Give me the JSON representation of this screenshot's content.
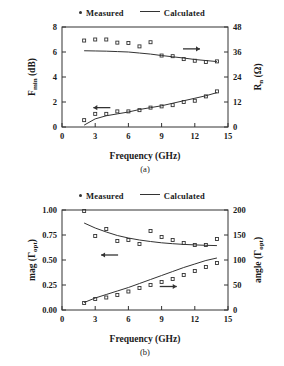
{
  "figure": {
    "caption_a": "(a)",
    "caption_b": "(b)"
  },
  "legend": {
    "measured_label": "Measured",
    "calculated_label": "Calculated",
    "measured_icon": "filled-dot-marker",
    "calculated_icon": "solid-line-sample"
  },
  "chart_data": [
    {
      "type": "scatter",
      "panel": "a",
      "title": "",
      "xlabel": "Frequency (GHz)",
      "ylabel_left": "F_min (dB)",
      "ylabel_left_display": "F",
      "ylabel_left_sub": "min",
      "ylabel_left_unit": " (dB)",
      "ylabel_right": "R_n (Ω)",
      "ylabel_right_display": "R",
      "ylabel_right_sub": "n",
      "ylabel_right_unit": " (Ω)",
      "xlim": [
        0,
        15
      ],
      "xticks": [
        0,
        3,
        6,
        9,
        12,
        15
      ],
      "xticklabels": [
        "0",
        "3",
        "6",
        "9",
        "12",
        "15"
      ],
      "ylim_left": [
        0,
        8
      ],
      "yticks_left": [
        0,
        2,
        4,
        6,
        8
      ],
      "yticklabels_left": [
        "0",
        "2",
        "4",
        "6",
        "8"
      ],
      "ylim_right": [
        0,
        48
      ],
      "yticks_right": [
        0,
        12,
        24,
        36,
        48
      ],
      "yticklabels_right": [
        "0",
        "12",
        "24",
        "36",
        "48"
      ],
      "grid": false,
      "legend_position": "above-plot",
      "annotations": [
        {
          "name": "left-arrow-to-fmin-axis",
          "text": "←",
          "x": 3.6,
          "y": 1.55,
          "axis": "left"
        },
        {
          "name": "right-arrow-to-rn-axis",
          "text": "→",
          "x": 11.7,
          "y": 37.5,
          "axis": "right"
        }
      ],
      "series": [
        {
          "name": "R_n measured",
          "axis": "right",
          "marker": "open-square",
          "x": [
            2,
            3,
            4,
            5,
            6,
            7,
            8,
            9,
            10,
            11,
            12,
            13,
            14
          ],
          "y": [
            41.5,
            42.0,
            42.0,
            40.5,
            40.3,
            38.7,
            40.7,
            34.3,
            34.0,
            32.6,
            31.8,
            31.2,
            31.5
          ]
        },
        {
          "name": "R_n calculated",
          "axis": "right",
          "line": "solid",
          "x": [
            2,
            3,
            4,
            5,
            6,
            7,
            8,
            9,
            10,
            11,
            12,
            13,
            14
          ],
          "y": [
            36.6,
            36.5,
            36.4,
            36.2,
            36.0,
            35.5,
            35.0,
            34.3,
            33.7,
            33.1,
            32.4,
            31.9,
            31.4
          ]
        },
        {
          "name": "F_min measured",
          "axis": "left",
          "marker": "open-square",
          "x": [
            2,
            3,
            4,
            5,
            6,
            7,
            8,
            9,
            10,
            11,
            12,
            13,
            14
          ],
          "y": [
            0.55,
            1.05,
            1.05,
            1.25,
            1.25,
            1.35,
            1.55,
            1.65,
            1.75,
            2.0,
            2.1,
            2.45,
            2.85
          ]
        },
        {
          "name": "F_min calculated",
          "axis": "left",
          "line": "solid",
          "x": [
            2,
            3,
            4,
            5,
            6,
            7,
            8,
            9,
            10,
            11,
            12,
            13,
            14
          ],
          "y": [
            0.15,
            0.65,
            0.9,
            1.05,
            1.2,
            1.4,
            1.55,
            1.7,
            1.9,
            2.1,
            2.3,
            2.5,
            2.75
          ]
        }
      ]
    },
    {
      "type": "scatter",
      "panel": "b",
      "title": "",
      "xlabel": "Frequency (GHz)",
      "ylabel_left": "mag (Γ_opt)",
      "ylabel_left_display": "mag (Γ",
      "ylabel_left_sub": "opt",
      "ylabel_left_unit": ")",
      "ylabel_right": "angle (Γ_opt)",
      "ylabel_right_display": "angle (Γ",
      "ylabel_right_sub": "opt",
      "ylabel_right_unit": ")",
      "xlim": [
        0,
        15
      ],
      "xticks": [
        0,
        3,
        6,
        9,
        12,
        15
      ],
      "xticklabels": [
        "0",
        "3",
        "6",
        "9",
        "12",
        "15"
      ],
      "ylim_left": [
        0.0,
        1.0
      ],
      "yticks_left": [
        0.0,
        0.25,
        0.5,
        0.75,
        1.0
      ],
      "yticklabels_left": [
        "0.00",
        "0.25",
        "0.50",
        "0.75",
        "1.00"
      ],
      "ylim_right": [
        0,
        200
      ],
      "yticks_right": [
        0,
        50,
        100,
        150,
        200
      ],
      "yticklabels_right": [
        "0",
        "50",
        "100",
        "150",
        "200"
      ],
      "grid": false,
      "legend_position": "above-plot",
      "annotations": [
        {
          "name": "left-arrow-to-mag-axis",
          "text": "←",
          "x": 4.3,
          "y": 0.55,
          "axis": "left"
        },
        {
          "name": "right-arrow-to-angle-axis",
          "text": "→",
          "x": 9.6,
          "y": 47,
          "axis": "right"
        }
      ],
      "series": [
        {
          "name": "mag measured",
          "axis": "left",
          "marker": "open-square",
          "x": [
            2,
            3,
            4,
            5,
            6,
            7,
            8,
            9,
            10,
            11,
            12,
            13,
            14
          ],
          "y": [
            0.99,
            0.74,
            0.81,
            0.69,
            0.7,
            0.66,
            0.79,
            0.73,
            0.7,
            0.67,
            0.65,
            0.65,
            0.71
          ]
        },
        {
          "name": "mag calculated",
          "axis": "left",
          "line": "solid",
          "x": [
            2,
            3,
            4,
            5,
            6,
            7,
            8,
            9,
            10,
            11,
            12,
            13,
            14
          ],
          "y": [
            0.87,
            0.82,
            0.78,
            0.745,
            0.72,
            0.7,
            0.685,
            0.672,
            0.663,
            0.656,
            0.651,
            0.647,
            0.644
          ]
        },
        {
          "name": "angle measured",
          "axis": "right",
          "marker": "open-square",
          "x": [
            2,
            3,
            4,
            5,
            6,
            7,
            8,
            9,
            10,
            11,
            12,
            13,
            14
          ],
          "y": [
            14,
            22,
            25,
            30,
            37,
            44,
            50,
            56,
            62,
            70,
            78,
            86,
            94
          ]
        },
        {
          "name": "angle calculated",
          "axis": "right",
          "line": "solid",
          "x": [
            2,
            3,
            4,
            5,
            6,
            7,
            8,
            9,
            10,
            11,
            12,
            13,
            14
          ],
          "y": [
            15,
            24,
            31,
            38,
            45,
            53,
            61,
            69,
            77,
            85,
            92,
            99,
            104
          ]
        }
      ]
    }
  ]
}
